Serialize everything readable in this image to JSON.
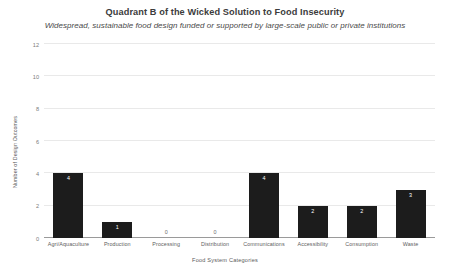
{
  "chart_data": {
    "type": "bar",
    "title": "Quadrant B of the Wicked Solution to Food Insecurity",
    "subtitle": "Widespread, sustainable food design funded or supported by large-scale public or private institutions",
    "xlabel": "Food System Categories",
    "ylabel": "Number of Design Outcomes",
    "categories": [
      "Agri/Aquaculture",
      "Production",
      "Processing",
      "Distribution",
      "Communications",
      "Accessibility",
      "Consumption",
      "Waste"
    ],
    "values": [
      4,
      1,
      0,
      0,
      4,
      2,
      2,
      3
    ],
    "value_labels": [
      "4",
      "1",
      "0",
      "0",
      "4",
      "2",
      "2",
      "3"
    ],
    "ylim": [
      0,
      12
    ],
    "yticks": [
      0,
      2,
      4,
      6,
      8,
      10,
      12
    ],
    "ytick_labels": [
      "0",
      "2",
      "4",
      "6",
      "8",
      "10",
      "12"
    ],
    "grid": true,
    "legend": false,
    "bar_color": "#1c1c1c",
    "gridline_color": "#e9e9e9",
    "axis_color": "#9a9a9a",
    "background_color": "#ffffff",
    "value_label_color_inside": "#ffffff",
    "value_label_color_zero": "#6e6e6e"
  }
}
